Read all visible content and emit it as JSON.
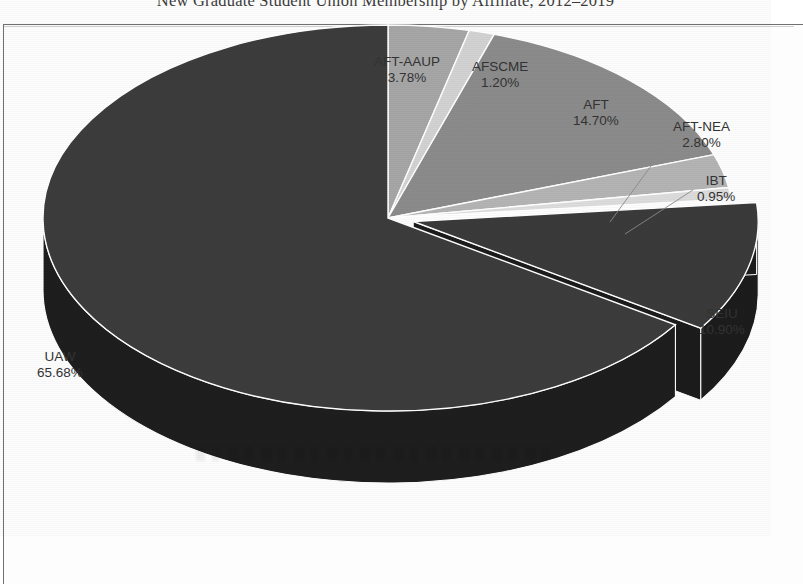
{
  "title": "New Graduate Student Union Membership by Affiliate, 2012–2019",
  "chart_data": {
    "type": "pie",
    "title": "New Graduate Student Union Membership by Affiliate, 2012–2019",
    "xlabel": "",
    "ylabel": "",
    "units": "percent",
    "three_d": true,
    "exploded_slices": [
      "SEIU"
    ],
    "legend_position": "none",
    "labels_position": "outside",
    "grid": false,
    "categories": [
      "AFT-AAUP",
      "AFSCME",
      "AFT",
      "AFT-NEA",
      "IBT",
      "SEIU",
      "UAW"
    ],
    "values": [
      3.78,
      1.2,
      14.7,
      2.8,
      0.95,
      10.9,
      65.68
    ],
    "value_labels": [
      "3.78%",
      "1.20%",
      "14.70%",
      "2.80%",
      "0.95%",
      "10.90%",
      "65.68%"
    ],
    "colors": [
      "#a6a6a6",
      "#d2d2d2",
      "#8b8b8b",
      "#b4b4b4",
      "#dcdcdc",
      "#3a3a3a",
      "#3c3c3c"
    ],
    "slices": [
      {
        "name": "AFT-AAUP",
        "value": 3.78,
        "value_label": "3.78%",
        "color": "#a6a6a6",
        "side_color": "#7d7d7d",
        "exploded": false,
        "leader_line": false
      },
      {
        "name": "AFSCME",
        "value": 1.2,
        "value_label": "1.20%",
        "color": "#d2d2d2",
        "side_color": "#a3a3a3",
        "exploded": false,
        "leader_line": true
      },
      {
        "name": "AFT",
        "value": 14.7,
        "value_label": "14.70%",
        "color": "#8b8b8b",
        "side_color": "#686868",
        "exploded": false,
        "leader_line": false
      },
      {
        "name": "AFT-NEA",
        "value": 2.8,
        "value_label": "2.80%",
        "color": "#b4b4b4",
        "side_color": "#8a8a8a",
        "exploded": false,
        "leader_line": true
      },
      {
        "name": "IBT",
        "value": 0.95,
        "value_label": "0.95%",
        "color": "#dcdcdc",
        "side_color": "#ababab",
        "exploded": false,
        "leader_line": true
      },
      {
        "name": "SEIU",
        "value": 10.9,
        "value_label": "10.90%",
        "color": "#3a3a3a",
        "side_color": "#1c1c1c",
        "exploded": true,
        "leader_line": false
      },
      {
        "name": "UAW",
        "value": 65.68,
        "value_label": "65.68%",
        "color": "#3c3c3c",
        "side_color": "#1e1e1e",
        "exploded": false,
        "leader_line": false
      }
    ]
  },
  "labels": {
    "aft_aaup": {
      "name": "AFT-AAUP",
      "pct": "3.78%"
    },
    "afscme": {
      "name": "AFSCME",
      "pct": "1.20%"
    },
    "aft": {
      "name": "AFT",
      "pct": "14.70%"
    },
    "aft_nea": {
      "name": "AFT-NEA",
      "pct": "2.80%"
    },
    "ibt": {
      "name": "IBT",
      "pct": "0.95%"
    },
    "seiu": {
      "name": "SEIU",
      "pct": "10.90%"
    },
    "uaw": {
      "name": "UAW",
      "pct": "65.68%"
    }
  },
  "style": {
    "outline_color": "#ffffff",
    "frame_color": "#70706e",
    "text_color": "#333333",
    "background": "#fdfdfd"
  }
}
